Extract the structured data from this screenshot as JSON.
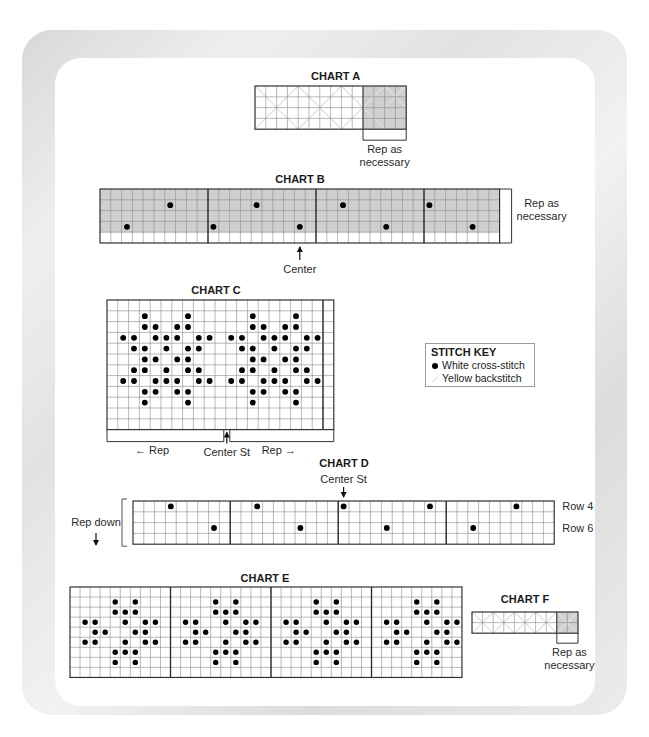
{
  "stitch_key": {
    "title": "STITCH KEY",
    "items": [
      {
        "symbol": "filled-dot",
        "label": "White cross-stitch"
      },
      {
        "symbol": "diagonal-line",
        "label": "Yellow backstitch"
      }
    ]
  },
  "colors": {
    "grid_line": "#8a8a8a",
    "shade": "#cfcfcf",
    "dot": "#000000",
    "backstitch": "#e0e0e0"
  },
  "chart_data": [
    {
      "type": "table",
      "title": "CHART A",
      "x": 255,
      "y": 86,
      "cell": 10.8,
      "cols": 14,
      "rows": 4,
      "shaded_cols": [
        10,
        13
      ],
      "backstitch_x": true,
      "dots": [],
      "annotation": {
        "text_lines": [
          "Rep as",
          "necessary"
        ],
        "bracket_cols": [
          10,
          14
        ],
        "position": "below"
      }
    },
    {
      "type": "table",
      "title": "CHART B",
      "x": 100,
      "y": 189,
      "cell": 10.8,
      "cols": 37,
      "rows": 5,
      "shaded_rows": [
        0,
        3
      ],
      "section_lines": [
        10,
        20,
        30
      ],
      "dots": [
        [
          3,
          2
        ],
        [
          1,
          6
        ],
        [
          3,
          10
        ],
        [
          1,
          14
        ],
        [
          3,
          18
        ],
        [
          1,
          22
        ],
        [
          3,
          26
        ],
        [
          1,
          30
        ],
        [
          3,
          34
        ]
      ],
      "annotations": [
        {
          "text_lines": [
            "Rep as",
            "necessary"
          ],
          "position": "right",
          "bracket_rows": [
            0,
            4
          ]
        },
        {
          "text": "Center",
          "arrow": "up",
          "col": 18
        }
      ]
    },
    {
      "type": "table",
      "title": "CHART C",
      "x": 107,
      "y": 300,
      "cell": 10.8,
      "cols": 21,
      "rows": 12,
      "section_lines": [
        20
      ],
      "dots": [
        [
          1,
          3
        ],
        [
          1,
          7
        ],
        [
          2,
          3
        ],
        [
          2,
          4
        ],
        [
          2,
          6
        ],
        [
          2,
          7
        ],
        [
          3,
          1
        ],
        [
          3,
          2
        ],
        [
          3,
          4
        ],
        [
          3,
          5
        ],
        [
          3,
          6
        ],
        [
          3,
          8
        ],
        [
          3,
          9
        ],
        [
          4,
          2
        ],
        [
          4,
          3
        ],
        [
          4,
          5
        ],
        [
          4,
          7
        ],
        [
          4,
          8
        ],
        [
          5,
          3
        ],
        [
          5,
          4
        ],
        [
          5,
          6
        ],
        [
          5,
          7
        ],
        [
          6,
          2
        ],
        [
          6,
          3
        ],
        [
          6,
          5
        ],
        [
          6,
          7
        ],
        [
          6,
          8
        ],
        [
          7,
          1
        ],
        [
          7,
          2
        ],
        [
          7,
          4
        ],
        [
          7,
          5
        ],
        [
          7,
          6
        ],
        [
          7,
          8
        ],
        [
          7,
          9
        ],
        [
          8,
          3
        ],
        [
          8,
          4
        ],
        [
          8,
          6
        ],
        [
          8,
          7
        ],
        [
          9,
          3
        ],
        [
          9,
          7
        ],
        [
          1,
          13
        ],
        [
          1,
          17
        ],
        [
          2,
          13
        ],
        [
          2,
          14
        ],
        [
          2,
          16
        ],
        [
          2,
          17
        ],
        [
          3,
          11
        ],
        [
          3,
          12
        ],
        [
          3,
          14
        ],
        [
          3,
          15
        ],
        [
          3,
          16
        ],
        [
          3,
          18
        ],
        [
          3,
          19
        ],
        [
          4,
          12
        ],
        [
          4,
          13
        ],
        [
          4,
          15
        ],
        [
          4,
          17
        ],
        [
          4,
          18
        ],
        [
          5,
          13
        ],
        [
          5,
          14
        ],
        [
          5,
          16
        ],
        [
          5,
          17
        ],
        [
          6,
          12
        ],
        [
          6,
          13
        ],
        [
          6,
          15
        ],
        [
          6,
          17
        ],
        [
          6,
          18
        ],
        [
          7,
          11
        ],
        [
          7,
          12
        ],
        [
          7,
          14
        ],
        [
          7,
          15
        ],
        [
          7,
          16
        ],
        [
          7,
          18
        ],
        [
          7,
          19
        ],
        [
          8,
          13
        ],
        [
          8,
          14
        ],
        [
          8,
          16
        ],
        [
          8,
          17
        ],
        [
          9,
          13
        ],
        [
          9,
          17
        ]
      ],
      "annotations": [
        {
          "text": "← Rep",
          "position": "below-left"
        },
        {
          "text": "Center St",
          "arrow": "up",
          "col": 11
        },
        {
          "text": "Rep →",
          "position": "below-right"
        }
      ]
    },
    {
      "type": "table",
      "title": "CHART D",
      "x": 133,
      "y": 501,
      "cell": 10.8,
      "cols": 39,
      "rows": 4,
      "section_lines": [
        9,
        19,
        29
      ],
      "dots": [
        [
          0,
          3
        ],
        [
          2,
          7
        ],
        [
          0,
          11
        ],
        [
          2,
          15
        ],
        [
          0,
          19
        ],
        [
          2,
          23
        ],
        [
          0,
          27
        ],
        [
          2,
          31
        ],
        [
          0,
          35
        ]
      ],
      "row_labels": [
        {
          "row": 0,
          "text": "Row 4"
        },
        {
          "row": 2,
          "text": "Row 6"
        }
      ],
      "annotations": [
        {
          "text": "Center St",
          "arrow": "down",
          "col": 19
        },
        {
          "text_lines": [
            "Rep down"
          ],
          "arrow": "down",
          "position": "left"
        }
      ]
    },
    {
      "type": "table",
      "title": "CHART E",
      "x": 70,
      "y": 587,
      "cell": 10.05,
      "cols": 39,
      "rows": 9,
      "section_lines": [
        10,
        20,
        30
      ],
      "dots_motif": [
        [
          1,
          4
        ],
        [
          1,
          6
        ],
        [
          2,
          4
        ],
        [
          2,
          5
        ],
        [
          2,
          6
        ],
        [
          3,
          1
        ],
        [
          3,
          2
        ],
        [
          3,
          5
        ],
        [
          3,
          7
        ],
        [
          3,
          8
        ],
        [
          4,
          2
        ],
        [
          4,
          3
        ],
        [
          4,
          6
        ],
        [
          4,
          7
        ],
        [
          5,
          1
        ],
        [
          5,
          2
        ],
        [
          5,
          5
        ],
        [
          5,
          7
        ],
        [
          5,
          8
        ],
        [
          6,
          4
        ],
        [
          6,
          5
        ],
        [
          6,
          6
        ],
        [
          7,
          4
        ],
        [
          7,
          6
        ]
      ],
      "motif_repeat_every": 10,
      "motif_count": 4
    },
    {
      "type": "table",
      "title": "CHART F",
      "x": 472,
      "y": 612,
      "cell": 10.6,
      "cols": 10,
      "rows": 2,
      "shaded_cols": [
        8,
        9
      ],
      "backstitch_x": true,
      "dots": [],
      "annotation": {
        "text_lines": [
          "Rep as",
          "necessary"
        ],
        "bracket_cols": [
          8,
          10
        ],
        "position": "below"
      }
    }
  ]
}
